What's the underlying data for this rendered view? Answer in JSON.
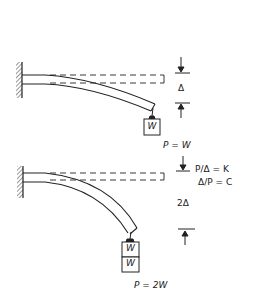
{
  "diagram": {
    "figure_1": {
      "load_label": "P = W",
      "deflection_label": "Δ",
      "weights": [
        "W"
      ]
    },
    "figure_2": {
      "load_label": "P = 2W",
      "deflection_label": "2Δ",
      "stiffness_formula": "P/Δ = K",
      "compliance_formula": "Δ/P = C",
      "weights": [
        "W",
        "W"
      ]
    },
    "colors": {
      "line": "#222222",
      "background": "#ffffff"
    }
  }
}
